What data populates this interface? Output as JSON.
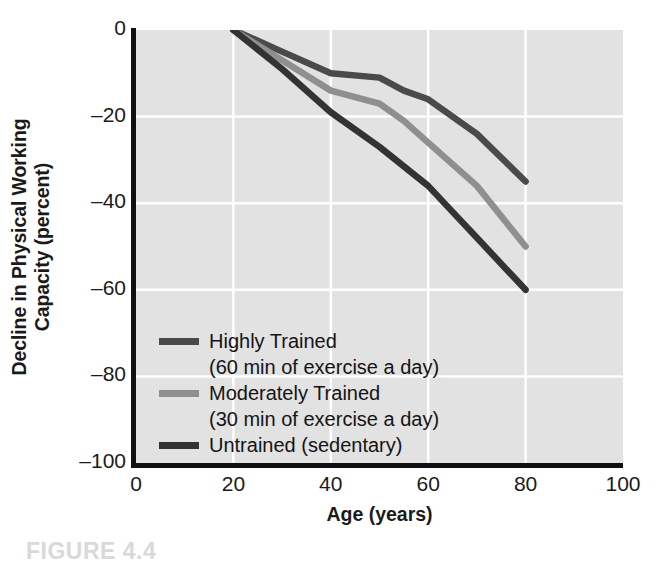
{
  "chart_data": {
    "type": "line",
    "title": "",
    "xlabel": "Age (years)",
    "ylabel": "Decline in Physical Working Capacity (percent)",
    "ylabel_line1": "Decline in Physical Working",
    "ylabel_line2": "Capacity (percent)",
    "xlim": [
      0,
      100
    ],
    "ylim": [
      -100,
      0
    ],
    "xticks": [
      0,
      20,
      40,
      60,
      80,
      100
    ],
    "xtick_labels": [
      "0",
      "20",
      "40",
      "60",
      "80",
      "100"
    ],
    "yticks": [
      0,
      -20,
      -40,
      -60,
      -80,
      -100
    ],
    "ytick_labels": [
      "0",
      "–20",
      "–40",
      "–60",
      "–80",
      "–100"
    ],
    "grid": true,
    "grid_color": "#ffffff",
    "plot_background": "#e2e2e2",
    "legend_position": "lower-left-inside",
    "series": [
      {
        "name": "Highly Trained",
        "sublabel": "(60 min of exercise a day)",
        "color": "#4a4a4a",
        "x": [
          20,
          30,
          40,
          50,
          55,
          60,
          70,
          80
        ],
        "values": [
          0,
          -5,
          -10,
          -11,
          -14,
          -16,
          -24,
          -35
        ]
      },
      {
        "name": "Moderately Trained",
        "sublabel": "(30 min of exercise a day)",
        "color": "#8f8f8f",
        "x": [
          20,
          30,
          40,
          50,
          55,
          60,
          70,
          80
        ],
        "values": [
          0,
          -7,
          -14,
          -17,
          -21,
          -26,
          -36,
          -50
        ]
      },
      {
        "name": "Untrained (sedentary)",
        "sublabel": "",
        "color": "#333333",
        "x": [
          20,
          30,
          40,
          50,
          60,
          65,
          70,
          80
        ],
        "values": [
          0,
          -9,
          -19,
          -27,
          -36,
          -42,
          -48,
          -60
        ]
      }
    ]
  },
  "caption": {
    "text": "FIGURE 4.4"
  }
}
